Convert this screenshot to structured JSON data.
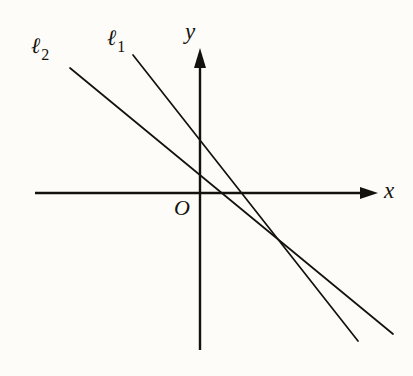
{
  "figure": {
    "background_color": "#fdfcf8",
    "ink_color": "#15120e"
  },
  "labels": {
    "x_axis": "x",
    "y_axis": "y",
    "origin": "O",
    "line1_symbol": "ℓ",
    "line1_subscript": "1",
    "line2_symbol": "ℓ",
    "line2_subscript": "2"
  },
  "chart_data": {
    "type": "line",
    "title": "",
    "xlabel": "x",
    "ylabel": "y",
    "grid": false,
    "legend": "none",
    "axes": {
      "origin_px": [
        200,
        193
      ],
      "x_axis_px": {
        "from": [
          35,
          193
        ],
        "to": [
          378,
          193
        ],
        "arrow": "right"
      },
      "y_axis_px": {
        "from": [
          200,
          350
        ],
        "to": [
          200,
          50
        ],
        "arrow": "up"
      }
    },
    "series": [
      {
        "name": "ℓ1",
        "label": "ℓ",
        "subscript": "1",
        "from_px": [
          133,
          55
        ],
        "to_px": [
          358,
          341
        ],
        "slope_px_per_px": -1.271,
        "y_intercept_px": [
          200,
          141
        ],
        "x_intercept_px": [
          239,
          193
        ],
        "label_px": [
          107,
          27
        ],
        "description": "steeper negative-slope line"
      },
      {
        "name": "ℓ2",
        "label": "ℓ",
        "subscript": "2",
        "from_px": [
          70,
          68
        ],
        "to_px": [
          393,
          334
        ],
        "slope_px_per_px": -0.824,
        "y_intercept_px": [
          200,
          170
        ],
        "x_intercept_px": [
          255,
          193
        ],
        "label_px": [
          31,
          35
        ],
        "description": "shallower negative-slope line"
      }
    ],
    "annotations": [
      {
        "name": "intersection",
        "point_px": [
          272,
          233
        ],
        "label": ""
      }
    ]
  }
}
